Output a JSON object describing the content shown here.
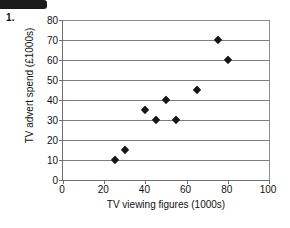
{
  "question": {
    "number": "1."
  },
  "chart_data": {
    "type": "scatter",
    "title": "",
    "xlabel": "TV viewing figures (1000s)",
    "ylabel": "TV advert spend (£1000s)",
    "xlim": [
      0,
      100
    ],
    "ylim": [
      0,
      80
    ],
    "xticks": [
      0,
      20,
      40,
      60,
      80,
      100
    ],
    "yticks": [
      0,
      10,
      20,
      30,
      40,
      50,
      60,
      70,
      80
    ],
    "xtick_labels": [
      "0",
      "20",
      "40",
      "60",
      "80",
      "100"
    ],
    "ytick_labels": [
      "0",
      "10",
      "20",
      "30",
      "40",
      "50",
      "60",
      "70",
      "80"
    ],
    "grid": "horizontal",
    "legend": "none",
    "marker": "diamond",
    "marker_color": "#151515",
    "x": [
      25,
      30,
      40,
      45,
      50,
      55,
      65,
      75,
      80
    ],
    "y": [
      10,
      15,
      35,
      30,
      40,
      30,
      45,
      70,
      60
    ],
    "points": [
      {
        "x": 25,
        "y": 10
      },
      {
        "x": 30,
        "y": 15
      },
      {
        "x": 40,
        "y": 35
      },
      {
        "x": 45,
        "y": 30
      },
      {
        "x": 50,
        "y": 40
      },
      {
        "x": 55,
        "y": 30
      },
      {
        "x": 65,
        "y": 45
      },
      {
        "x": 75,
        "y": 70
      },
      {
        "x": 80,
        "y": 60
      }
    ]
  }
}
